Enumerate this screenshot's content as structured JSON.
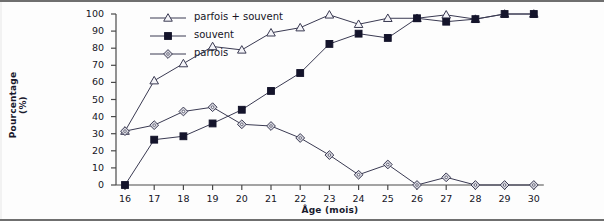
{
  "chart_data": {
    "type": "line",
    "title": "",
    "xlabel": "Âge (mois)",
    "ylabel": "Pourcentage (%)",
    "x": [
      16,
      17,
      18,
      19,
      20,
      21,
      22,
      23,
      24,
      25,
      26,
      27,
      28,
      29,
      30
    ],
    "xticklabels": [
      "16",
      "17",
      "18",
      "19",
      "20",
      "21",
      "22",
      "23",
      "24",
      "25",
      "26",
      "27",
      "28",
      "29",
      "30"
    ],
    "yticklabels": [
      "0",
      "10",
      "20",
      "30",
      "40",
      "50",
      "60",
      "70",
      "80",
      "90",
      "100"
    ],
    "xlim": [
      15.5,
      30.5
    ],
    "ylim": [
      0,
      100
    ],
    "grid": false,
    "legend_position": "top-left",
    "series": [
      {
        "name": "parfois + souvent",
        "marker": "triangle-open",
        "values": [
          31.5,
          61,
          71,
          81,
          79,
          89,
          92,
          99.5,
          94,
          97.5,
          97.5,
          99.5,
          97,
          100,
          100
        ]
      },
      {
        "name": "souvent",
        "marker": "square-filled",
        "values": [
          0,
          26.5,
          28.5,
          36,
          44,
          55,
          65.5,
          82.5,
          88.5,
          86,
          97.5,
          95.5,
          97,
          100,
          100
        ]
      },
      {
        "name": "parfois",
        "marker": "diamond-open",
        "values": [
          31.5,
          35,
          43,
          45.5,
          35.5,
          34.5,
          27.5,
          17.5,
          6,
          12,
          0,
          4.5,
          0,
          0,
          0
        ]
      }
    ]
  },
  "legend": {
    "items": [
      {
        "label": "parfois + souvent"
      },
      {
        "label": "souvent"
      },
      {
        "label": "parfois"
      }
    ]
  },
  "colors": {
    "line": "#3a3a52",
    "marker_fill": "#d8d8e0",
    "marker_filled": "#14142b",
    "axis": "#4a4a4a",
    "text": "#15151f"
  }
}
